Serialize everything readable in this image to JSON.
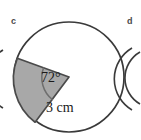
{
  "figure": {
    "part_label_c": "c",
    "part_label_d": "d",
    "angle_label": "72°",
    "radius_label": "3 cm",
    "angle_degrees": 72,
    "radius_value": 3,
    "radius_unit": "cm",
    "shape": "circle-with-shaded-sector",
    "colors": {
      "outline": "#3a3a3a",
      "sector_fill": "#a8a8a8",
      "sector_outline": "#4a4a4a",
      "angle_arc": "#6e6e6e",
      "label_text": "#1a1a1a",
      "part_label_text": "#4a4a4a",
      "background": "#ffffff"
    },
    "geometry": {
      "center_x": 69,
      "center_y": 77,
      "radius_px": 55,
      "sector_start_angle_deg": 160,
      "sector_end_angle_deg": 232
    }
  }
}
